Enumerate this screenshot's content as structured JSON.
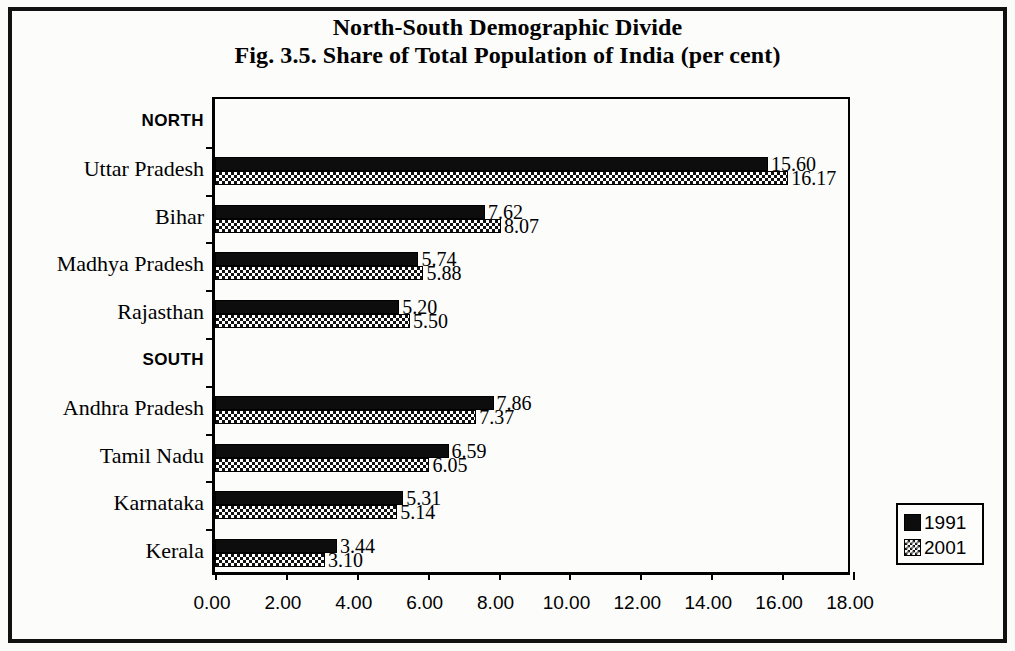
{
  "title": {
    "main": "North-South Demographic Divide",
    "sub": "Fig. 3.5. Share of Total Population of India (per cent)"
  },
  "legend": {
    "entries": [
      {
        "label": "1991",
        "pattern": "solid-black",
        "color": "#0d0d0d"
      },
      {
        "label": "2001",
        "pattern": "checker",
        "color": "#ffffff"
      }
    ]
  },
  "axis": {
    "x_ticks": [
      "0.00",
      "2.00",
      "4.00",
      "6.00",
      "8.00",
      "10.00",
      "12.00",
      "14.00",
      "16.00",
      "18.00"
    ],
    "x_min": 0,
    "x_max": 18,
    "x_step": 2
  },
  "groups": [
    {
      "label": "NORTH",
      "type": "group"
    },
    {
      "label": "SOUTH",
      "type": "group"
    }
  ],
  "chart_data": {
    "type": "bar",
    "orientation": "horizontal",
    "title": "North-South Demographic Divide",
    "subtitle": "Fig. 3.5. Share of Total Population of India (per cent)",
    "xlabel": "",
    "ylabel": "",
    "xlim": [
      0,
      18
    ],
    "x_ticks": [
      0,
      2,
      4,
      6,
      8,
      10,
      12,
      14,
      16,
      18
    ],
    "grid": false,
    "legend_position": "right-bottom-outside",
    "categories": [
      "NORTH",
      "Uttar Pradesh",
      "Bihar",
      "Madhya Pradesh",
      "Rajasthan",
      "SOUTH",
      "Andhra Pradesh",
      "Tamil Nadu",
      "Karnataka",
      "Kerala"
    ],
    "series": [
      {
        "name": "1991",
        "values": [
          null,
          15.6,
          7.62,
          5.74,
          5.2,
          null,
          7.86,
          6.59,
          5.31,
          3.44
        ]
      },
      {
        "name": "2001",
        "values": [
          null,
          16.17,
          8.07,
          5.88,
          5.5,
          null,
          7.37,
          6.05,
          5.14,
          3.1
        ]
      }
    ],
    "data_labels": {
      "1991": [
        "",
        "15.60",
        "7.62",
        "5.74",
        "5.20",
        "",
        "7.86",
        "6.59",
        "5.31",
        "3.44"
      ],
      "2001": [
        "",
        "16.17",
        "8.07",
        "5.88",
        "5.50",
        "",
        "7.37",
        "6.05",
        "5.14",
        "3.10"
      ]
    }
  }
}
